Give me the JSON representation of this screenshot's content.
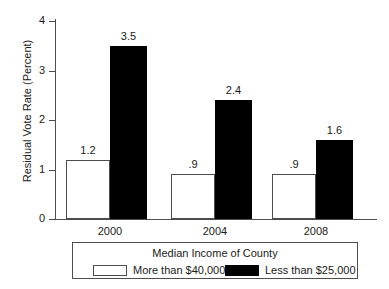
{
  "chart_data": {
    "type": "bar",
    "title": "",
    "xlabel": "",
    "ylabel": "Residual Vote Rate (Percent)",
    "categories": [
      "2000",
      "2004",
      "2008"
    ],
    "series": [
      {
        "name": "More than $40,000",
        "swatch": "light",
        "color": "#ffffff",
        "values": [
          1.2,
          0.9,
          0.9
        ],
        "labels": [
          "1.2",
          ".9",
          ".9"
        ]
      },
      {
        "name": "Less than $25,000",
        "swatch": "dark",
        "color": "#000000",
        "values": [
          3.5,
          2.4,
          1.6
        ],
        "labels": [
          "3.5",
          "2.4",
          "1.6"
        ]
      }
    ],
    "ylim": [
      0,
      4
    ],
    "yticks": [
      0,
      1,
      2,
      3,
      4
    ],
    "ytick_labels": [
      "0",
      "1",
      "2",
      "3",
      "4"
    ],
    "grid": false,
    "legend_position": "bottom",
    "legend_title": "Median Income of County"
  },
  "colors": {
    "axis": "#4d4d4d",
    "text": "#1a1a1a",
    "background": "#ffffff",
    "bar_light": "#ffffff",
    "bar_dark": "#000000"
  }
}
